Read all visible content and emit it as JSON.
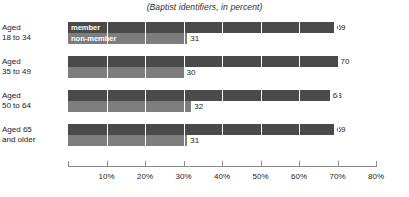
{
  "chart_data": {
    "type": "bar",
    "orientation": "horizontal",
    "title": "(Baptist identifiers, in percent)",
    "xlabel": "",
    "ylabel": "",
    "xlim": [
      0,
      80
    ],
    "xticks": [
      0,
      10,
      20,
      30,
      40,
      50,
      60,
      70,
      80
    ],
    "xtick_labels": [
      "",
      "10%",
      "20%",
      "30%",
      "40%",
      "50%",
      "60%",
      "70%",
      "80%"
    ],
    "grid": true,
    "legend_position": "inside-first-bars",
    "categories": [
      "Aged 18 to 34",
      "Aged 35 to 49",
      "Aged 50 to 64",
      "Aged 65 and older"
    ],
    "category_lines": [
      [
        "Aged",
        "18 to 34"
      ],
      [
        "Aged",
        "35 to 49"
      ],
      [
        "Aged",
        "50 to 64"
      ],
      [
        "Aged 65",
        "and older"
      ]
    ],
    "series": [
      {
        "name": "member",
        "color": "#4a4a4a",
        "values": [
          69,
          70,
          68,
          69
        ]
      },
      {
        "name": "non-member",
        "color": "#7d7d7d",
        "values": [
          31,
          30,
          32,
          31
        ]
      }
    ]
  }
}
